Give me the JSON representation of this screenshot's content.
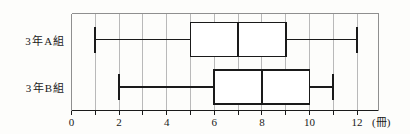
{
  "chart_data": {
    "type": "box",
    "orientation": "horizontal",
    "title": "",
    "xlabel": "",
    "ylabel": "",
    "unit_label": "(冊)",
    "xlim": [
      0,
      12.9
    ],
    "grid": true,
    "grid_step": 1,
    "legend": "none",
    "categories": [
      "3年A組",
      "3年B組"
    ],
    "tick_values": [
      0,
      1,
      2,
      3,
      4,
      5,
      6,
      7,
      8,
      9,
      10,
      11,
      12
    ],
    "tick_labels": [
      "0",
      "",
      "2",
      "",
      "4",
      "",
      "6",
      "",
      "8",
      "",
      "10",
      "",
      "12"
    ],
    "boxes": [
      {
        "name": "3年A組",
        "min": 1,
        "q1": 5,
        "median": 7,
        "q3": 9,
        "max": 12
      },
      {
        "name": "3年B組",
        "min": 2,
        "q1": 6,
        "median": 8,
        "q3": 10,
        "max": 11
      }
    ],
    "colors": {
      "line": "#1a1a1a",
      "box_fill": "#ffffff",
      "grid": "#b9b9b9",
      "frame": "#8f8f8f",
      "background": "#fdfdfb"
    }
  }
}
